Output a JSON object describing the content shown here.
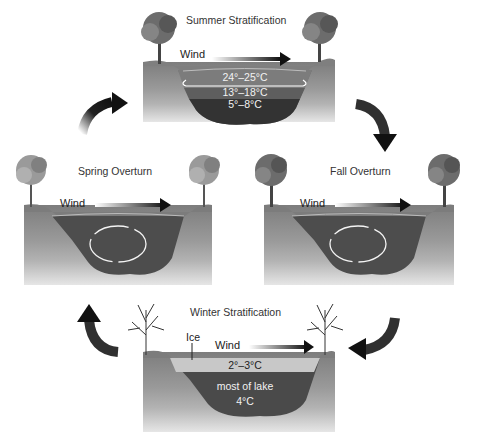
{
  "diagram": {
    "type": "cycle",
    "panels": [
      {
        "id": "summer",
        "title": "Summer Stratification",
        "wind_label": "Wind",
        "layers": [
          "24°–25°C",
          "13°–18°C",
          "5°–8°C"
        ]
      },
      {
        "id": "fall",
        "title": "Fall Overturn",
        "wind_label": "Wind",
        "circulation": "mixing"
      },
      {
        "id": "winter",
        "title": "Winter Stratification",
        "wind_label": "Wind",
        "ice_label": "Ice",
        "layers": [
          "2°–3°C",
          "most of lake",
          "4°C"
        ]
      },
      {
        "id": "spring",
        "title": "Spring Overturn",
        "wind_label": "Wind",
        "circulation": "mixing"
      }
    ],
    "cycle_order": [
      "summer",
      "fall",
      "winter",
      "spring"
    ],
    "colors": {
      "water_dark": "#3a3a3a",
      "water_mid": "#5d5d5d",
      "water_top": "#7a7a7a",
      "ice": "#c8c8c8",
      "land": "#8a8a8a",
      "arrow": "#1a1a1a"
    }
  }
}
